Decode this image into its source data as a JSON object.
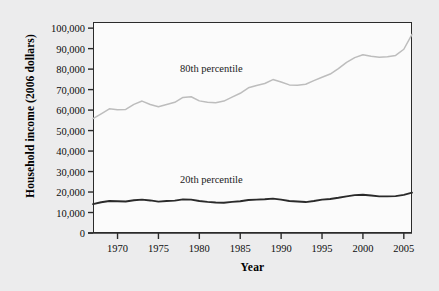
{
  "chart_data": {
    "type": "line",
    "title": "",
    "xlabel": "Year",
    "ylabel": "Household income (2006 dollars)",
    "xlim": [
      1967,
      2006
    ],
    "ylim": [
      0,
      103000
    ],
    "xticks": [
      1970,
      1975,
      1980,
      1985,
      1990,
      1995,
      2000,
      2005
    ],
    "xtick_labels": [
      "1970",
      "1975",
      "1980",
      "1985",
      "1990",
      "1995",
      "2000",
      "2005"
    ],
    "yticks": [
      0,
      10000,
      20000,
      30000,
      40000,
      50000,
      60000,
      70000,
      80000,
      90000,
      100000
    ],
    "ytick_labels": [
      "0",
      "10,000",
      "20,000",
      "30,000",
      "40,000",
      "50,000",
      "60,000",
      "70,000",
      "80,000",
      "90,000",
      "100,000"
    ],
    "grid": false,
    "legend_position": "inline-annotation",
    "x": [
      1967,
      1968,
      1969,
      1970,
      1971,
      1972,
      1973,
      1974,
      1975,
      1976,
      1977,
      1978,
      1979,
      1980,
      1981,
      1982,
      1983,
      1984,
      1985,
      1986,
      1987,
      1988,
      1989,
      1990,
      1991,
      1992,
      1993,
      1994,
      1995,
      1996,
      1997,
      1998,
      1999,
      2000,
      2001,
      2002,
      2003,
      2004,
      2005,
      2006
    ],
    "series": [
      {
        "name": "80th percentile",
        "label": "80th percentile",
        "color": "#bdbdbd",
        "values": [
          55800,
          58200,
          60600,
          60200,
          60300,
          62800,
          64400,
          62700,
          61600,
          62700,
          63800,
          66200,
          66500,
          64500,
          63800,
          63600,
          64400,
          66300,
          68200,
          70900,
          72000,
          73000,
          74900,
          73700,
          72300,
          72100,
          72600,
          74400,
          76000,
          77600,
          80200,
          83300,
          85600,
          87000,
          86300,
          85800,
          86000,
          86700,
          89700,
          97000
        ]
      },
      {
        "name": "20th percentile",
        "label": "20th percentile",
        "color": "#2a2a2a",
        "values": [
          14100,
          15000,
          15600,
          15500,
          15400,
          16000,
          16300,
          15900,
          15300,
          15600,
          15800,
          16400,
          16300,
          15600,
          15200,
          14900,
          14800,
          15200,
          15500,
          16100,
          16300,
          16500,
          16800,
          16300,
          15600,
          15400,
          15100,
          15600,
          16300,
          16600,
          17200,
          17900,
          18500,
          18700,
          18300,
          17900,
          17900,
          18000,
          18600,
          19700
        ]
      }
    ]
  },
  "axes": {
    "xlabel": "Year",
    "ylabel": "Household income (2006 dollars)"
  }
}
